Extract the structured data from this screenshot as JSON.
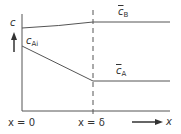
{
  "diagram": {
    "y_axis_label": "c",
    "x_axis_label": "x",
    "labels": {
      "c_ai": {
        "main": "c",
        "sub": "Ai"
      },
      "c_b": {
        "main": "c",
        "sub": "B"
      },
      "c_a": {
        "main": "c",
        "sub": "A"
      },
      "x0": "x = 0",
      "xdelta": "x = δ"
    },
    "line_color": "#555555"
  }
}
